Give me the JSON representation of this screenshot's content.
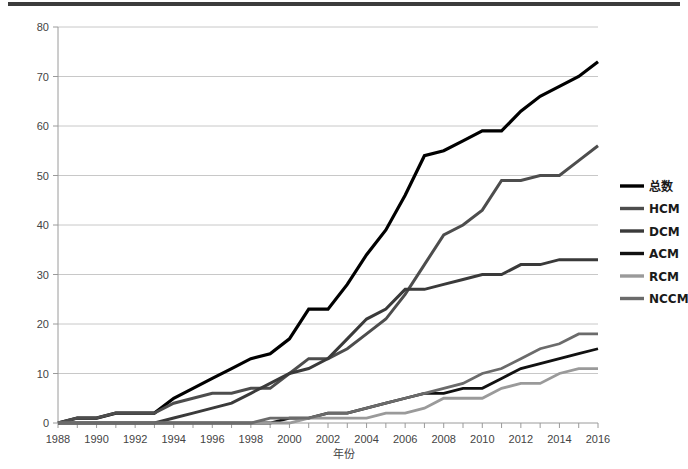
{
  "figure": {
    "background": "#ffffff",
    "top_rule_color": "#3c3c3c"
  },
  "axis": {
    "x_title": "年份",
    "y_ticks": [
      "0",
      "10",
      "20",
      "30",
      "40",
      "50",
      "60",
      "70",
      "80"
    ],
    "x_ticks": [
      "1988",
      "1990",
      "1992",
      "1994",
      "1996",
      "1998",
      "2000",
      "2002",
      "2004",
      "2006",
      "2008",
      "2010",
      "2012",
      "2014",
      "2016"
    ]
  },
  "legend": {
    "position": "right",
    "items": [
      {
        "label": "总数",
        "color": "#000000"
      },
      {
        "label": "HCM",
        "color": "#4d4d4d"
      },
      {
        "label": "DCM",
        "color": "#3a3a3a"
      },
      {
        "label": "ACM",
        "color": "#111111"
      },
      {
        "label": "RCM",
        "color": "#9a9a9a"
      },
      {
        "label": "NCCM",
        "color": "#6b6b6b"
      }
    ]
  },
  "chart_data": {
    "type": "line",
    "title": "",
    "xlabel": "年份",
    "ylabel": "",
    "xlim": [
      1988,
      2016
    ],
    "ylim": [
      0,
      80
    ],
    "grid": true,
    "legend_position": "right",
    "x": [
      1988,
      1989,
      1990,
      1991,
      1992,
      1993,
      1994,
      1995,
      1996,
      1997,
      1998,
      1999,
      2000,
      2001,
      2002,
      2003,
      2004,
      2005,
      2006,
      2007,
      2008,
      2009,
      2010,
      2011,
      2012,
      2013,
      2014,
      2015,
      2016
    ],
    "series": [
      {
        "name": "总数",
        "color": "#000000",
        "width": 3.2,
        "values": [
          0,
          1,
          1,
          2,
          2,
          2,
          5,
          7,
          9,
          11,
          13,
          14,
          17,
          23,
          23,
          28,
          34,
          39,
          46,
          54,
          55,
          57,
          59,
          59,
          63,
          66,
          68,
          70,
          73
        ]
      },
      {
        "name": "HCM",
        "color": "#4d4d4d",
        "width": 3.0,
        "values": [
          0,
          1,
          1,
          2,
          2,
          2,
          4,
          5,
          6,
          6,
          7,
          7,
          10,
          13,
          13,
          15,
          18,
          21,
          26,
          32,
          38,
          40,
          43,
          49,
          49,
          50,
          50,
          53,
          56
        ]
      },
      {
        "name": "DCM",
        "color": "#3a3a3a",
        "width": 3.0,
        "values": [
          0,
          0,
          0,
          0,
          0,
          0,
          1,
          2,
          3,
          4,
          6,
          8,
          10,
          11,
          13,
          17,
          21,
          23,
          27,
          27,
          28,
          29,
          30,
          30,
          32,
          32,
          33,
          33,
          33
        ]
      },
      {
        "name": "ACM",
        "color": "#111111",
        "width": 2.8,
        "values": [
          0,
          0,
          0,
          0,
          0,
          0,
          0,
          0,
          0,
          0,
          0,
          0,
          1,
          1,
          2,
          2,
          3,
          4,
          5,
          6,
          6,
          7,
          7,
          9,
          11,
          12,
          13,
          14,
          15
        ]
      },
      {
        "name": "RCM",
        "color": "#9a9a9a",
        "width": 2.8,
        "values": [
          0,
          0,
          0,
          0,
          0,
          0,
          0,
          0,
          0,
          0,
          0,
          0,
          0,
          1,
          1,
          1,
          1,
          2,
          2,
          3,
          5,
          5,
          5,
          7,
          8,
          8,
          10,
          11,
          11
        ]
      },
      {
        "name": "NCCM",
        "color": "#6b6b6b",
        "width": 2.8,
        "values": [
          0,
          0,
          0,
          0,
          0,
          0,
          0,
          0,
          0,
          0,
          0,
          1,
          1,
          1,
          2,
          2,
          3,
          4,
          5,
          6,
          7,
          8,
          10,
          11,
          13,
          15,
          16,
          18,
          18
        ]
      }
    ]
  }
}
